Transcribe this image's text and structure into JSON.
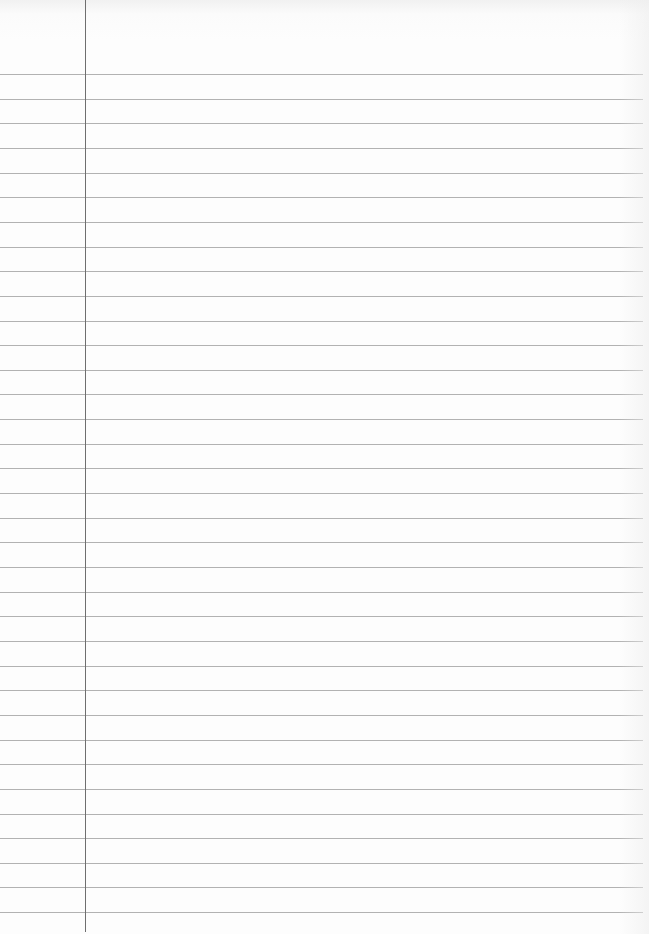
{
  "page": {
    "type": "lined-notebook-paper",
    "background_color": "#fdfdfd",
    "rule_color": "#b2b2b2",
    "margin_color": "#6f6f6f"
  },
  "rules": {
    "first_y": 74,
    "spacing": 24.65,
    "count": 35,
    "width": 643
  },
  "margin": {
    "x": 85,
    "height": 932
  },
  "text_content": []
}
